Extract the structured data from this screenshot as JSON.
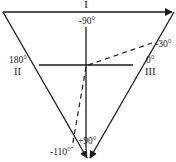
{
  "diagram": {
    "leads": {
      "lead_I": "I",
      "lead_II": "II",
      "lead_III": "III"
    },
    "angles": {
      "top": "-90°",
      "left": "180°",
      "right": "0°",
      "upper_right": "-30°",
      "bottom": "+90°",
      "bottom_left": "-110°"
    },
    "colors": {
      "stroke": "#1a1a1a",
      "background": "#ffffff"
    }
  }
}
